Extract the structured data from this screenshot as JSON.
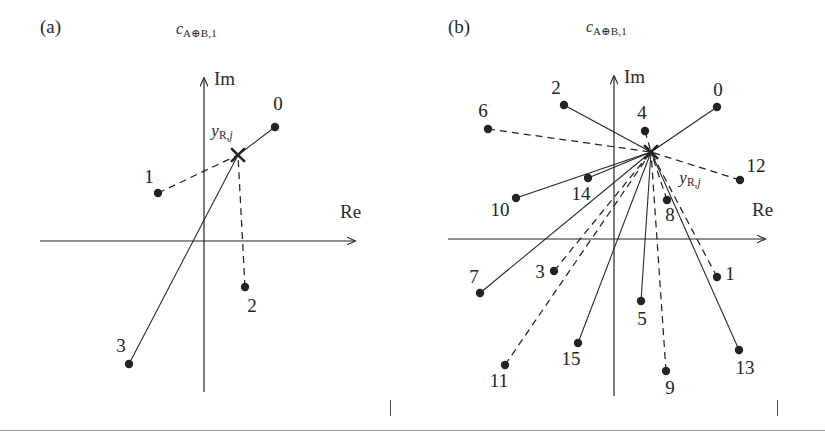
{
  "figure": {
    "width": 825,
    "height": 435,
    "background": "#ffffff",
    "ink_color": "#232323",
    "bottom_rule_color": "#9a9a9a"
  },
  "panels": [
    {
      "id": "a",
      "label": "(a)",
      "title_base": "c",
      "title_sub": "A⊕B,1",
      "axis_re": "Re",
      "axis_im": "Im",
      "received_symbol_base": "y",
      "received_symbol_sub": "R,",
      "received_symbol_subit": "j"
    },
    {
      "id": "b",
      "label": "(b)",
      "title_base": "c",
      "title_sub": "A⊕B,1",
      "axis_re": "Re",
      "axis_im": "Im",
      "received_symbol_base": "y",
      "received_symbol_sub": "R,",
      "received_symbol_subit": "j"
    }
  ],
  "chart_data": [
    {
      "type": "scatter",
      "panel": "a",
      "title": "c_{A⊕B,1}",
      "panel_label": "(a)",
      "xlabel": "Re",
      "ylabel": "Im",
      "grid": false,
      "legend": null,
      "constellation_size": 4,
      "origin_px": {
        "x": 204,
        "y": 241
      },
      "axes_px": {
        "re_x_start": 40,
        "re_x_end": 355,
        "re_y": 241,
        "im_y_start": 78,
        "im_y_end": 392,
        "im_x": 204
      },
      "received_point": {
        "label": "y_{R,j}",
        "marker": "x",
        "x_px": 238,
        "y_px": 155,
        "label_x_px": 222,
        "label_y_px": 131
      },
      "points": [
        {
          "index": "0",
          "x_px": 275,
          "y_px": 127,
          "label_x_px": 278,
          "label_y_px": 104,
          "line_style": "solid"
        },
        {
          "index": "1",
          "x_px": 158,
          "y_px": 193,
          "label_x_px": 149,
          "label_y_px": 177,
          "line_style": "dashed"
        },
        {
          "index": "2",
          "x_px": 245,
          "y_px": 287,
          "label_x_px": 252,
          "label_y_px": 306,
          "line_style": "dashed"
        },
        {
          "index": "3",
          "x_px": 129,
          "y_px": 364,
          "label_x_px": 121,
          "label_y_px": 346,
          "line_style": "solid"
        }
      ]
    },
    {
      "type": "scatter",
      "panel": "b",
      "title": "c_{A⊕B,1}",
      "panel_label": "(b)",
      "xlabel": "Re",
      "ylabel": "Im",
      "grid": false,
      "legend": null,
      "constellation_size": 16,
      "origin_px": {
        "x": 202,
        "y": 239
      },
      "axes_px": {
        "re_x_start": 36,
        "re_x_end": 353,
        "re_y": 239,
        "im_y_start": 76,
        "im_y_end": 396,
        "im_x": 202
      },
      "received_point": {
        "label": "y_{R,j}",
        "marker": "x",
        "x_px": 239,
        "y_px": 152,
        "label_x_px": 278,
        "label_y_px": 178
      },
      "points": [
        {
          "index": "0",
          "x_px": 305,
          "y_px": 107,
          "label_x_px": 306,
          "label_y_px": 90,
          "line_style": "solid"
        },
        {
          "index": "1",
          "x_px": 305,
          "y_px": 277,
          "label_x_px": 318,
          "label_y_px": 274,
          "line_style": "dashed"
        },
        {
          "index": "2",
          "x_px": 152,
          "y_px": 105,
          "label_x_px": 144,
          "label_y_px": 88,
          "line_style": "solid"
        },
        {
          "index": "3",
          "x_px": 142,
          "y_px": 271,
          "label_x_px": 128,
          "label_y_px": 272,
          "line_style": "dashed"
        },
        {
          "index": "4",
          "x_px": 233,
          "y_px": 131,
          "label_x_px": 230,
          "label_y_px": 113,
          "line_style": "dashed"
        },
        {
          "index": "5",
          "x_px": 229,
          "y_px": 301,
          "label_x_px": 230,
          "label_y_px": 319,
          "line_style": "solid"
        },
        {
          "index": "6",
          "x_px": 76,
          "y_px": 129,
          "label_x_px": 71,
          "label_y_px": 111,
          "line_style": "dashed"
        },
        {
          "index": "7",
          "x_px": 68,
          "y_px": 293,
          "label_x_px": 62,
          "label_y_px": 277,
          "line_style": "solid"
        },
        {
          "index": "8",
          "x_px": 255,
          "y_px": 200,
          "label_x_px": 258,
          "label_y_px": 215,
          "line_style": "dashed"
        },
        {
          "index": "9",
          "x_px": 254,
          "y_px": 371,
          "label_x_px": 258,
          "label_y_px": 388,
          "line_style": "dashed"
        },
        {
          "index": "10",
          "x_px": 104,
          "y_px": 198,
          "label_x_px": 88,
          "label_y_px": 210,
          "line_style": "solid"
        },
        {
          "index": "11",
          "x_px": 93,
          "y_px": 365,
          "label_x_px": 87,
          "label_y_px": 381,
          "line_style": "dashed"
        },
        {
          "index": "12",
          "x_px": 328,
          "y_px": 180,
          "label_x_px": 344,
          "label_y_px": 166,
          "line_style": "dashed"
        },
        {
          "index": "13",
          "x_px": 327,
          "y_px": 350,
          "label_x_px": 333,
          "label_y_px": 368,
          "line_style": "solid"
        },
        {
          "index": "14",
          "x_px": 176,
          "y_px": 178,
          "label_x_px": 169,
          "label_y_px": 194,
          "line_style": "solid"
        },
        {
          "index": "15",
          "x_px": 166,
          "y_px": 343,
          "label_x_px": 159,
          "label_y_px": 359,
          "line_style": "solid"
        }
      ]
    }
  ]
}
